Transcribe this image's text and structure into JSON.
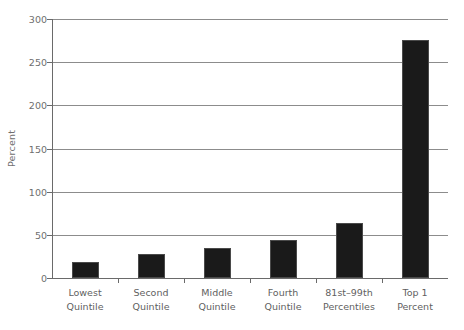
{
  "chart_data": {
    "type": "bar",
    "title": "",
    "subtitle": "",
    "xlabel": "",
    "ylabel": "Percent",
    "ylim": [
      0,
      300
    ],
    "yticks": [
      0,
      50,
      100,
      150,
      200,
      250,
      300
    ],
    "ytick_labels": [
      "0",
      "50",
      "100",
      "150",
      "200",
      "250",
      "300"
    ],
    "grid": true,
    "legend": false,
    "bar_color": "#1a1a1a",
    "categories": [
      "Lowest Quintile",
      "Second Quintile",
      "Middle Quintile",
      "Fourth Quintile",
      "81st–99th Percentiles",
      "Top 1 Percent"
    ],
    "category_lines": [
      [
        "Lowest",
        "Quintile"
      ],
      [
        "Second",
        "Quintile"
      ],
      [
        "Middle",
        "Quintile"
      ],
      [
        "Fourth",
        "Quintile"
      ],
      [
        "81st–99th",
        "Percentiles"
      ],
      [
        "Top 1",
        "Percent"
      ]
    ],
    "values": [
      18,
      28,
      35,
      44,
      64,
      276
    ]
  }
}
